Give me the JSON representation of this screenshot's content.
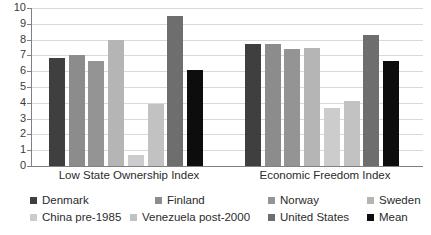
{
  "chart_data": {
    "type": "bar",
    "title": "",
    "subtitle": "",
    "xlabel": "",
    "ylabel": "",
    "ylim": [
      0,
      10
    ],
    "ytick_labels": [
      "10",
      "9",
      "8",
      "7",
      "6",
      "5",
      "4",
      "3",
      "2",
      "1",
      "0"
    ],
    "ytick_values": [
      10,
      9,
      8,
      7,
      6,
      5,
      4,
      3,
      2,
      1,
      0
    ],
    "grid": true,
    "legend_position": "bottom",
    "categories": [
      "Low State Ownership Index",
      "Economic Freedom Index"
    ],
    "series": [
      {
        "name": "Denmark",
        "color": "#3f3f3f",
        "values": [
          6.85,
          7.75
        ]
      },
      {
        "name": "Finland",
        "color": "#8c8c8c",
        "values": [
          7.05,
          7.75
        ]
      },
      {
        "name": "Norway",
        "color": "#949494",
        "values": [
          6.65,
          7.4
        ]
      },
      {
        "name": "Sweden",
        "color": "#b5b5b5",
        "values": [
          8.0,
          7.45
        ]
      },
      {
        "name": "China pre-1985",
        "color": "#cccccc",
        "values": [
          0.7,
          3.7
        ]
      },
      {
        "name": "Venezuela post-2000",
        "color": "#c2c2c2",
        "values": [
          3.9,
          4.1
        ]
      },
      {
        "name": "United States",
        "color": "#6e6e6e",
        "values": [
          9.5,
          8.3
        ]
      },
      {
        "name": "Mean",
        "color": "#0d0d0d",
        "values": [
          6.05,
          6.65
        ]
      }
    ]
  },
  "legend": {
    "rows": [
      [
        {
          "label": "Denmark",
          "color": "#3f3f3f"
        },
        {
          "label": "Finland",
          "color": "#8c8c8c"
        },
        {
          "label": "Norway",
          "color": "#949494"
        },
        {
          "label": "Sweden",
          "color": "#b5b5b5"
        }
      ],
      [
        {
          "label": "China pre-1985",
          "color": "#cccccc"
        },
        {
          "label": "Venezuela post-2000",
          "color": "#c2c2c2"
        },
        {
          "label": "United States",
          "color": "#6e6e6e"
        },
        {
          "label": "Mean",
          "color": "#0d0d0d"
        }
      ]
    ]
  },
  "axes": {
    "grid_color": "#d9d9d9",
    "axis_color": "#808080"
  }
}
